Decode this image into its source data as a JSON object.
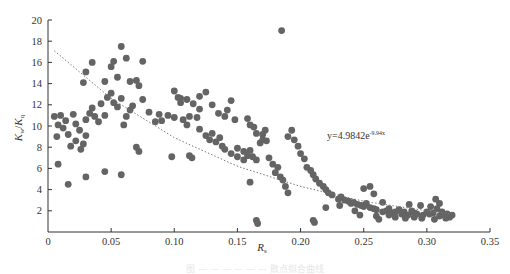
{
  "chart_data": {
    "type": "scatter",
    "title": "",
    "xlabel": "R_s",
    "xlabel_main": "R",
    "xlabel_sub": "s",
    "ylabel": "K_w/K_q",
    "ylabel_parts": {
      "k1": "K",
      "sub1": "w",
      "slash": "/",
      "k2": "K",
      "sub2": "q"
    },
    "xlim": [
      0,
      0.35
    ],
    "ylim": [
      0,
      20
    ],
    "x_ticks": [
      "0",
      "0.05",
      "0.10",
      "0.15",
      "0.20",
      "0.25",
      "0.30",
      "0.35"
    ],
    "y_ticks": [
      "2",
      "4",
      "6",
      "8",
      "10",
      "12",
      "14",
      "16",
      "18",
      "20"
    ],
    "grid": false,
    "legend": null,
    "marker_color": "#646464",
    "trendline": {
      "style": "dotted",
      "color": "#777777",
      "label": "y=4.9842e",
      "label_exponent": "-9.94x",
      "approx_points": [
        [
          0.005,
          17.1
        ],
        [
          0.05,
          12.6
        ],
        [
          0.1,
          8.9
        ],
        [
          0.15,
          6.2
        ],
        [
          0.2,
          4.3
        ],
        [
          0.25,
          2.9
        ],
        [
          0.3,
          2.0
        ],
        [
          0.32,
          1.7
        ]
      ]
    },
    "series": [
      {
        "name": "K_w/K_q vs R_s",
        "points": [
          [
            0.005,
            10.9
          ],
          [
            0.007,
            9.0
          ],
          [
            0.008,
            10.1
          ],
          [
            0.01,
            11.0
          ],
          [
            0.012,
            9.8
          ],
          [
            0.014,
            10.5
          ],
          [
            0.016,
            9.2
          ],
          [
            0.018,
            8.1
          ],
          [
            0.02,
            11.1
          ],
          [
            0.022,
            10.2
          ],
          [
            0.022,
            8.6
          ],
          [
            0.025,
            9.6
          ],
          [
            0.026,
            7.8
          ],
          [
            0.028,
            8.3
          ],
          [
            0.03,
            9.1
          ],
          [
            0.03,
            10.6
          ],
          [
            0.033,
            11.2
          ],
          [
            0.035,
            11.7
          ],
          [
            0.037,
            10.9
          ],
          [
            0.04,
            10.4
          ],
          [
            0.042,
            12.1
          ],
          [
            0.045,
            11.0
          ],
          [
            0.047,
            12.7
          ],
          [
            0.05,
            13.1
          ],
          [
            0.052,
            12.2
          ],
          [
            0.055,
            11.8
          ],
          [
            0.058,
            12.6
          ],
          [
            0.06,
            10.1
          ],
          [
            0.062,
            10.9
          ],
          [
            0.065,
            11.5
          ],
          [
            0.067,
            11.9
          ],
          [
            0.008,
            6.4
          ],
          [
            0.016,
            4.5
          ],
          [
            0.03,
            5.2
          ],
          [
            0.045,
            5.7
          ],
          [
            0.058,
            5.4
          ],
          [
            0.07,
            8.0
          ],
          [
            0.072,
            7.6
          ],
          [
            0.098,
            7.1
          ],
          [
            0.028,
            14.1
          ],
          [
            0.03,
            15.1
          ],
          [
            0.035,
            16.0
          ],
          [
            0.045,
            14.2
          ],
          [
            0.05,
            15.6
          ],
          [
            0.052,
            16.1
          ],
          [
            0.055,
            14.6
          ],
          [
            0.058,
            17.5
          ],
          [
            0.062,
            16.4
          ],
          [
            0.065,
            14.2
          ],
          [
            0.07,
            14.3
          ],
          [
            0.072,
            13.8
          ],
          [
            0.075,
            16.1
          ],
          [
            0.075,
            12.5
          ],
          [
            0.08,
            11.3
          ],
          [
            0.085,
            10.4
          ],
          [
            0.088,
            11.1
          ],
          [
            0.09,
            10.5
          ],
          [
            0.095,
            11.0
          ],
          [
            0.1,
            10.8
          ],
          [
            0.103,
            12.7
          ],
          [
            0.105,
            12.2
          ],
          [
            0.107,
            10.6
          ],
          [
            0.11,
            10.1
          ],
          [
            0.112,
            10.9
          ],
          [
            0.115,
            12.1
          ],
          [
            0.118,
            10.8
          ],
          [
            0.12,
            11.6
          ],
          [
            0.1,
            13.3
          ],
          [
            0.105,
            12.6
          ],
          [
            0.11,
            12.5
          ],
          [
            0.12,
            12.8
          ],
          [
            0.125,
            13.2
          ],
          [
            0.13,
            12.0
          ],
          [
            0.135,
            11.2
          ],
          [
            0.14,
            10.9
          ],
          [
            0.142,
            11.5
          ],
          [
            0.145,
            12.4
          ],
          [
            0.148,
            10.6
          ],
          [
            0.112,
            7.2
          ],
          [
            0.114,
            7.0
          ],
          [
            0.15,
            7.1
          ],
          [
            0.158,
            10.7
          ],
          [
            0.16,
            10.1
          ],
          [
            0.163,
            9.9
          ],
          [
            0.165,
            9.3
          ],
          [
            0.168,
            8.4
          ],
          [
            0.17,
            8.7
          ],
          [
            0.172,
            9.6
          ],
          [
            0.12,
            9.7
          ],
          [
            0.125,
            9.1
          ],
          [
            0.128,
            8.7
          ],
          [
            0.13,
            9.3
          ],
          [
            0.133,
            8.5
          ],
          [
            0.136,
            8.9
          ],
          [
            0.138,
            8.1
          ],
          [
            0.14,
            7.8
          ],
          [
            0.145,
            7.4
          ],
          [
            0.15,
            7.9
          ],
          [
            0.155,
            7.6
          ],
          [
            0.158,
            7.2
          ],
          [
            0.16,
            7.7
          ],
          [
            0.162,
            7.1
          ],
          [
            0.165,
            6.8
          ],
          [
            0.155,
            6.8
          ],
          [
            0.16,
            4.7
          ],
          [
            0.165,
            1.1
          ],
          [
            0.166,
            0.8
          ],
          [
            0.17,
            9.2
          ],
          [
            0.173,
            8.6
          ],
          [
            0.175,
            7.0
          ],
          [
            0.178,
            6.4
          ],
          [
            0.18,
            5.6
          ],
          [
            0.182,
            6.1
          ],
          [
            0.184,
            5.2
          ],
          [
            0.186,
            4.9
          ],
          [
            0.188,
            4.3
          ],
          [
            0.19,
            3.7
          ],
          [
            0.185,
            19.0
          ],
          [
            0.19,
            9.0
          ],
          [
            0.193,
            9.6
          ],
          [
            0.195,
            8.7
          ],
          [
            0.198,
            8.1
          ],
          [
            0.2,
            7.4
          ],
          [
            0.203,
            6.9
          ],
          [
            0.205,
            6.1
          ],
          [
            0.208,
            5.8
          ],
          [
            0.21,
            5.4
          ],
          [
            0.212,
            5.0
          ],
          [
            0.215,
            4.6
          ],
          [
            0.218,
            4.3
          ],
          [
            0.22,
            4.0
          ],
          [
            0.222,
            3.7
          ],
          [
            0.225,
            3.5
          ],
          [
            0.21,
            1.1
          ],
          [
            0.211,
            0.9
          ],
          [
            0.23,
            3.1
          ],
          [
            0.232,
            3.3
          ],
          [
            0.235,
            3.0
          ],
          [
            0.238,
            2.9
          ],
          [
            0.24,
            2.7
          ],
          [
            0.242,
            2.8
          ],
          [
            0.245,
            2.6
          ],
          [
            0.248,
            2.5
          ],
          [
            0.25,
            2.4
          ],
          [
            0.252,
            2.7
          ],
          [
            0.255,
            2.3
          ],
          [
            0.258,
            2.2
          ],
          [
            0.26,
            2.1
          ],
          [
            0.25,
            4.1
          ],
          [
            0.255,
            4.3
          ],
          [
            0.258,
            3.6
          ],
          [
            0.26,
            1.5
          ],
          [
            0.262,
            1.2
          ],
          [
            0.265,
            1.9
          ],
          [
            0.268,
            2.0
          ],
          [
            0.27,
            2.2
          ],
          [
            0.272,
            1.8
          ],
          [
            0.275,
            1.9
          ],
          [
            0.278,
            2.1
          ],
          [
            0.28,
            1.7
          ],
          [
            0.282,
            1.9
          ],
          [
            0.285,
            1.6
          ],
          [
            0.288,
            2.0
          ],
          [
            0.29,
            1.8
          ],
          [
            0.292,
            1.7
          ],
          [
            0.295,
            2.5
          ],
          [
            0.297,
            1.6
          ],
          [
            0.3,
            1.9
          ],
          [
            0.302,
            1.7
          ],
          [
            0.305,
            1.8
          ],
          [
            0.307,
            3.1
          ],
          [
            0.308,
            2.2
          ],
          [
            0.31,
            1.5
          ],
          [
            0.312,
            1.9
          ],
          [
            0.314,
            1.6
          ],
          [
            0.316,
            1.7
          ],
          [
            0.318,
            1.4
          ],
          [
            0.32,
            1.6
          ],
          [
            0.275,
            1.4
          ],
          [
            0.283,
            1.3
          ],
          [
            0.286,
            2.6
          ],
          [
            0.29,
            1.4
          ],
          [
            0.296,
            1.3
          ],
          [
            0.303,
            2.4
          ],
          [
            0.306,
            1.2
          ],
          [
            0.31,
            2.7
          ],
          [
            0.315,
            1.3
          ],
          [
            0.22,
            2.3
          ],
          [
            0.231,
            2.5
          ],
          [
            0.243,
            2.0
          ],
          [
            0.247,
            1.6
          ],
          [
            0.265,
            2.8
          ],
          [
            0.27,
            1.6
          ]
        ]
      }
    ]
  },
  "caption": "图 — — — — — — 散点拟合曲线"
}
